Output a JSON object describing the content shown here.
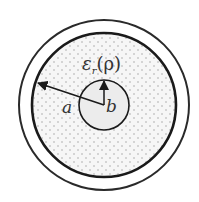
{
  "diagram": {
    "labels": {
      "permittivity": "ε",
      "permittivity_sub": "r",
      "permittivity_arg": "(ρ)",
      "outer_radius": "a",
      "inner_radius": "b"
    },
    "colors": {
      "stroke": "#1a1a1a",
      "dielectric_fill": "#f4f4f4",
      "dot": "#9a9a9a",
      "conductor_fill": "#ececec",
      "shield_fill": "#ffffff"
    },
    "geometry": {
      "center": [
        104,
        105
      ],
      "outer_shield_radius": 85,
      "dielectric_radius": 72,
      "inner_conductor_radius": 25
    }
  }
}
